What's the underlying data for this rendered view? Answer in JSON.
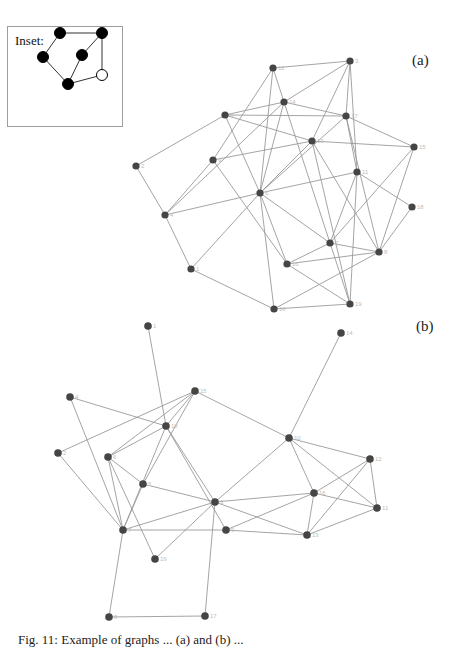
{
  "inset": {
    "title": "Inset:",
    "nodes": [
      {
        "id": "i1",
        "x": 59,
        "y": 32,
        "fill": "#000"
      },
      {
        "id": "i2",
        "x": 101,
        "y": 32,
        "fill": "#000"
      },
      {
        "id": "i3",
        "x": 42,
        "y": 56,
        "fill": "#000"
      },
      {
        "id": "i4",
        "x": 81,
        "y": 54,
        "fill": "#000"
      },
      {
        "id": "i5",
        "x": 67,
        "y": 83,
        "fill": "#000"
      },
      {
        "id": "i6",
        "x": 101,
        "y": 74,
        "fill": "#fff"
      }
    ],
    "edges": [
      [
        "i1",
        "i2"
      ],
      [
        "i1",
        "i3"
      ],
      [
        "i3",
        "i5"
      ],
      [
        "i5",
        "i4"
      ],
      [
        "i4",
        "i2"
      ],
      [
        "i2",
        "i6"
      ],
      [
        "i6",
        "i5"
      ]
    ]
  },
  "panel_a": {
    "label": "(a)",
    "nodes": [
      {
        "id": "a12",
        "x": 273,
        "y": 68,
        "label": "12"
      },
      {
        "id": "a3",
        "x": 350,
        "y": 61,
        "label": "3"
      },
      {
        "id": "a14",
        "x": 284,
        "y": 102,
        "label": "14"
      },
      {
        "id": "a5",
        "x": 225,
        "y": 115,
        "label": "5"
      },
      {
        "id": "a17",
        "x": 346,
        "y": 116,
        "label": "17"
      },
      {
        "id": "a13",
        "x": 312,
        "y": 141,
        "label": "13"
      },
      {
        "id": "a15",
        "x": 414,
        "y": 147,
        "label": "15"
      },
      {
        "id": "a9",
        "x": 213,
        "y": 160,
        "label": "9"
      },
      {
        "id": "a2",
        "x": 136,
        "y": 166,
        "label": "2"
      },
      {
        "id": "a6",
        "x": 260,
        "y": 193,
        "label": "6"
      },
      {
        "id": "a11",
        "x": 357,
        "y": 172,
        "label": "11"
      },
      {
        "id": "a18",
        "x": 412,
        "y": 207,
        "label": "18"
      },
      {
        "id": "a4",
        "x": 165,
        "y": 215,
        "label": "4"
      },
      {
        "id": "a7",
        "x": 330,
        "y": 243,
        "label": "7"
      },
      {
        "id": "a8",
        "x": 379,
        "y": 252,
        "label": "8"
      },
      {
        "id": "a16",
        "x": 287,
        "y": 264,
        "label": "16"
      },
      {
        "id": "a1",
        "x": 191,
        "y": 269,
        "label": "1"
      },
      {
        "id": "a10",
        "x": 274,
        "y": 309,
        "label": "10"
      },
      {
        "id": "a19",
        "x": 350,
        "y": 304,
        "label": "19"
      }
    ],
    "edges": [
      [
        "a12",
        "a3"
      ],
      [
        "a12",
        "a14"
      ],
      [
        "a12",
        "a6"
      ],
      [
        "a12",
        "a9"
      ],
      [
        "a3",
        "a14"
      ],
      [
        "a3",
        "a17"
      ],
      [
        "a3",
        "a11"
      ],
      [
        "a3",
        "a13"
      ],
      [
        "a14",
        "a5"
      ],
      [
        "a14",
        "a6"
      ],
      [
        "a14",
        "a17"
      ],
      [
        "a14",
        "a7"
      ],
      [
        "a14",
        "a4"
      ],
      [
        "a5",
        "a17"
      ],
      [
        "a5",
        "a13"
      ],
      [
        "a5",
        "a6"
      ],
      [
        "a5",
        "a2"
      ],
      [
        "a17",
        "a15"
      ],
      [
        "a17",
        "a6"
      ],
      [
        "a17",
        "a11"
      ],
      [
        "a17",
        "a8"
      ],
      [
        "a13",
        "a15"
      ],
      [
        "a13",
        "a6"
      ],
      [
        "a13",
        "a8"
      ],
      [
        "a13",
        "a19"
      ],
      [
        "a9",
        "a4"
      ],
      [
        "a9",
        "a16"
      ],
      [
        "a9",
        "a13"
      ],
      [
        "a2",
        "a4"
      ],
      [
        "a6",
        "a11"
      ],
      [
        "a6",
        "a4"
      ],
      [
        "a6",
        "a1"
      ],
      [
        "a6",
        "a10"
      ],
      [
        "a6",
        "a7"
      ],
      [
        "a6",
        "a16"
      ],
      [
        "a11",
        "a18"
      ],
      [
        "a11",
        "a7"
      ],
      [
        "a11",
        "a19"
      ],
      [
        "a15",
        "a8"
      ],
      [
        "a18",
        "a8"
      ],
      [
        "a4",
        "a1"
      ],
      [
        "a7",
        "a8"
      ],
      [
        "a7",
        "a16"
      ],
      [
        "a7",
        "a19"
      ],
      [
        "a8",
        "a16"
      ],
      [
        "a8",
        "a10"
      ],
      [
        "a16",
        "a19"
      ],
      [
        "a1",
        "a10"
      ],
      [
        "a10",
        "a19"
      ],
      [
        "a15",
        "a7"
      ]
    ]
  },
  "panel_b": {
    "label": "(b)",
    "nodes": [
      {
        "id": "b1",
        "x": 148,
        "y": 326,
        "label": "1"
      },
      {
        "id": "b4",
        "x": 70,
        "y": 397,
        "label": "4"
      },
      {
        "id": "b15",
        "x": 195,
        "y": 391,
        "label": "15"
      },
      {
        "id": "b18",
        "x": 166,
        "y": 426,
        "label": "18"
      },
      {
        "id": "b2",
        "x": 58,
        "y": 453,
        "label": "2"
      },
      {
        "id": "b6",
        "x": 108,
        "y": 457,
        "label": "6"
      },
      {
        "id": "b10",
        "x": 289,
        "y": 438,
        "label": "10"
      },
      {
        "id": "b14",
        "x": 341,
        "y": 333,
        "label": "14"
      },
      {
        "id": "b12",
        "x": 370,
        "y": 459,
        "label": "12"
      },
      {
        "id": "b5",
        "x": 143,
        "y": 484,
        "label": "5"
      },
      {
        "id": "b3",
        "x": 215,
        "y": 502,
        "label": "3"
      },
      {
        "id": "b16",
        "x": 314,
        "y": 493,
        "label": "16"
      },
      {
        "id": "b11",
        "x": 377,
        "y": 508,
        "label": "11"
      },
      {
        "id": "b7",
        "x": 123,
        "y": 530,
        "label": "7"
      },
      {
        "id": "b9",
        "x": 226,
        "y": 530,
        "label": "9"
      },
      {
        "id": "b13",
        "x": 307,
        "y": 535,
        "label": "13"
      },
      {
        "id": "b19",
        "x": 155,
        "y": 559,
        "label": "19"
      },
      {
        "id": "b8",
        "x": 109,
        "y": 617,
        "label": "8"
      },
      {
        "id": "b17",
        "x": 205,
        "y": 616,
        "label": "17"
      }
    ],
    "edges": [
      [
        "b1",
        "b18"
      ],
      [
        "b4",
        "b18"
      ],
      [
        "b4",
        "b7"
      ],
      [
        "b15",
        "b2"
      ],
      [
        "b15",
        "b6"
      ],
      [
        "b15",
        "b18"
      ],
      [
        "b15",
        "b10"
      ],
      [
        "b15",
        "b5"
      ],
      [
        "b18",
        "b6"
      ],
      [
        "b18",
        "b7"
      ],
      [
        "b18",
        "b3"
      ],
      [
        "b18",
        "b9"
      ],
      [
        "b2",
        "b7"
      ],
      [
        "b6",
        "b7"
      ],
      [
        "b6",
        "b5"
      ],
      [
        "b6",
        "b19"
      ],
      [
        "b10",
        "b14"
      ],
      [
        "b10",
        "b12"
      ],
      [
        "b10",
        "b3"
      ],
      [
        "b10",
        "b16"
      ],
      [
        "b10",
        "b11"
      ],
      [
        "b12",
        "b16"
      ],
      [
        "b12",
        "b11"
      ],
      [
        "b12",
        "b13"
      ],
      [
        "b5",
        "b3"
      ],
      [
        "b5",
        "b7"
      ],
      [
        "b3",
        "b7"
      ],
      [
        "b3",
        "b19"
      ],
      [
        "b3",
        "b17"
      ],
      [
        "b3",
        "b13"
      ],
      [
        "b3",
        "b16"
      ],
      [
        "b16",
        "b11"
      ],
      [
        "b16",
        "b13"
      ],
      [
        "b16",
        "b9"
      ],
      [
        "b11",
        "b13"
      ],
      [
        "b7",
        "b9"
      ],
      [
        "b7",
        "b8"
      ],
      [
        "b9",
        "b13"
      ],
      [
        "b8",
        "b17"
      ]
    ]
  },
  "caption": "Fig. 11: Example of graphs ... (a) and (b) ..."
}
